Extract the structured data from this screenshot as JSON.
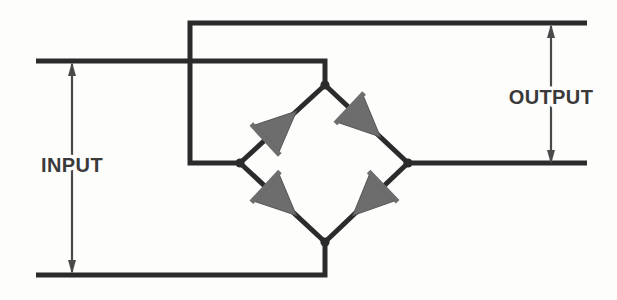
{
  "figure": {
    "background_color": "#fdfdfc",
    "wire_color": "#2b2b2b",
    "diode_fill_color": "#6d6d6d",
    "label_color": "#3a3a3a",
    "dimension_color": "#4a4a4a"
  },
  "labels": {
    "input": "INPUT",
    "output": "OUTPUT"
  },
  "dimensions": {
    "input": {
      "label": "INPUT",
      "x": 72,
      "top_y": 61,
      "bottom_y": 275,
      "label_x": 72,
      "label_y": 172
    },
    "output": {
      "label": "OUTPUT",
      "x": 551,
      "top_y": 23,
      "bottom_y": 165,
      "label_x": 551,
      "label_y": 104
    }
  },
  "nodes": {
    "bridge_top": {
      "name": "bridge-top-node",
      "x": 325,
      "y": 85
    },
    "bridge_left": {
      "name": "bridge-left-node",
      "x": 240,
      "y": 163
    },
    "bridge_right": {
      "name": "bridge-right-node",
      "x": 408,
      "y": 163
    },
    "bridge_bottom": {
      "name": "bridge-bottom-node",
      "x": 325,
      "y": 242
    },
    "input_corner_top": {
      "name": "input-top-corner",
      "x": 325,
      "y": 61
    },
    "input_corner_bottom": {
      "name": "input-bottom-corner",
      "x": 325,
      "y": 275
    },
    "output_corner_top": {
      "name": "output-top-corner",
      "x": 190,
      "y": 23
    },
    "output_tap_left": {
      "name": "output-left-tap",
      "x": 190,
      "y": 163
    }
  },
  "wires": [
    {
      "name": "input-top-rail",
      "path": "M 36 61 L 325 61 L 325 85"
    },
    {
      "name": "input-bottom-rail",
      "path": "M 36 275 L 325 275 L 325 242"
    },
    {
      "name": "output-top-rail",
      "path": "M 587 23 L 190 23 L 190 163 L 240 163"
    },
    {
      "name": "output-bottom-rail",
      "path": "M 408 163 L 587 163"
    }
  ],
  "diodes": [
    {
      "name": "diode-top-left",
      "from": "bridge_left",
      "to": "bridge_top",
      "direction": "up-right",
      "arm": "left-upper",
      "conducts_toward": "bridge-top-node"
    },
    {
      "name": "diode-top-right",
      "from": "bridge_top",
      "to": "bridge_right",
      "direction": "down-right",
      "arm": "right-upper",
      "conducts_toward": "bridge-right-node"
    },
    {
      "name": "diode-bottom-left",
      "from": "bridge_left",
      "to": "bridge_bottom",
      "direction": "down-right",
      "arm": "left-lower",
      "conducts_toward": "bridge-bottom-node"
    },
    {
      "name": "diode-bottom-right",
      "from": "bridge_right",
      "to": "bridge_bottom",
      "direction": "down-left",
      "arm": "right-lower",
      "conducts_toward": "bridge-bottom-node"
    }
  ]
}
